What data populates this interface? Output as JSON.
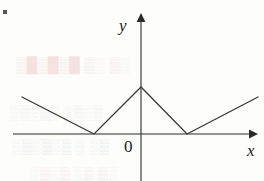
{
  "figure": {
    "origin_label": "0",
    "x_axis_label": "x",
    "y_axis_label": "y",
    "corner_mark": "·"
  },
  "background_bleed": [
    {
      "text": "░▒ ░▒ █▒█▒█▒",
      "x": 16,
      "y": 56,
      "size": 15,
      "tone": "red"
    },
    {
      "text": "▒░▒░ ░▒░▒░",
      "x": 10,
      "y": 104,
      "size": 14,
      "tone": "gray"
    },
    {
      "text": "▒░ ░ ▒░▒░▒░",
      "x": 12,
      "y": 138,
      "size": 14,
      "tone": "blue"
    },
    {
      "text": "░▒ ▒░ ▒░▒░",
      "x": 30,
      "y": 166,
      "size": 14,
      "tone": "red"
    }
  ],
  "chart_data": {
    "type": "line",
    "title": "",
    "xlabel": "x",
    "ylabel": "y",
    "grid": false,
    "legend": "none",
    "axes": {
      "x_axis_y_pixel": 134,
      "y_axis_x_pixel": 141,
      "x_axis_span_px": [
        13,
        253
      ],
      "y_axis_span_px": [
        14,
        181
      ],
      "x_arrow": true,
      "y_arrow": true
    },
    "vertices_px": [
      {
        "x": 22,
        "y": 97
      },
      {
        "x": 94,
        "y": 134
      },
      {
        "x": 141,
        "y": 87
      },
      {
        "x": 187,
        "y": 134
      },
      {
        "x": 258,
        "y": 97
      }
    ],
    "points": [
      {
        "x": -2.6,
        "y": 1.0,
        "kind": "endpoint"
      },
      {
        "x": -1.0,
        "y": 0.0,
        "kind": "minimum"
      },
      {
        "x": 0.0,
        "y": 1.0,
        "kind": "local-maximum"
      },
      {
        "x": 1.0,
        "y": 0.0,
        "kind": "minimum"
      },
      {
        "x": 2.6,
        "y": 1.0,
        "kind": "endpoint"
      }
    ],
    "xlim": [
      -2.9,
      3.0
    ],
    "ylim": [
      -1.0,
      2.6
    ]
  },
  "colors": {
    "ink": "#1b1b1b",
    "curve": "#3a3a3a",
    "axis": "#2b2b2b",
    "page": "#fdfdfc"
  }
}
